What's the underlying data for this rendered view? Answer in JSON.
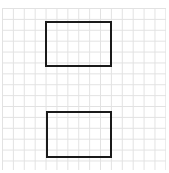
{
  "figure": {
    "caption_fragment": "",
    "grid": {
      "line_color": "#e2e2e2",
      "cell_size_px": 10.9
    },
    "shapes": [
      {
        "type": "rectangle",
        "name": "top-rectangle",
        "x": 45,
        "y": 21,
        "width": 67,
        "height": 46,
        "stroke": "#1a1a1a"
      },
      {
        "type": "rectangle",
        "name": "bottom-rectangle",
        "x": 46,
        "y": 111,
        "width": 66,
        "height": 47,
        "stroke": "#1a1a1a"
      }
    ]
  }
}
